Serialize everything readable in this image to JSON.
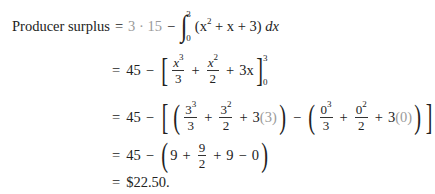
{
  "document": {
    "label": "Producer surplus",
    "lines": [
      {
        "id": "line1",
        "text": "Producer surplus = 3 · 15 − ∫_0^3 (x^2 + x + 3) dx",
        "parts": {
          "eq": "=",
          "product": "3 · 15",
          "minus": "−",
          "lower": "0",
          "upper": "3",
          "integrand": "(x",
          "exp2": "2",
          "rest": "+ x + 3)",
          "dx": "dx"
        }
      },
      {
        "id": "line2",
        "text": "= 45 − [x^3/3 + x^2/2 + 3x]_0^3",
        "parts": {
          "eq": "=",
          "const": "45",
          "minus": "−",
          "t1num": "x",
          "t1exp": "3",
          "t1den": "3",
          "plus1": "+",
          "t2num": "x",
          "t2exp": "2",
          "t2den": "2",
          "plus2": "+",
          "t3": "3x",
          "upper": "3",
          "lower": "0"
        }
      },
      {
        "id": "line3",
        "text": "= 45 − [(3^3/3 + 3^2/2 + 3(3)) − (0^3/3 + 0^2/2 + 3(0))]",
        "parts": {
          "eq": "=",
          "const": "45",
          "minus": "−",
          "a1num": "3",
          "a1exp": "3",
          "a1den": "3",
          "a2num": "3",
          "a2exp": "2",
          "a2den": "2",
          "a3": "3",
          "a3arg": "(3)",
          "minus2": "−",
          "b1num": "0",
          "b1exp": "3",
          "b1den": "3",
          "b2num": "0",
          "b2exp": "2",
          "b2den": "2",
          "b3": "3",
          "b3arg": "(0)",
          "plus": "+"
        }
      },
      {
        "id": "line4",
        "text": "= 45 − (9 + 9/2 + 9 − 0)",
        "parts": {
          "eq": "=",
          "const": "45",
          "minus": "−",
          "v1": "9",
          "plus1": "+",
          "fnum": "9",
          "fden": "2",
          "plus2": "+",
          "v3": "9",
          "minus2": "−",
          "v4": "0"
        }
      },
      {
        "id": "line5",
        "text": "= $22.50.",
        "parts": {
          "eq": "=",
          "result": "$22.50."
        }
      }
    ]
  },
  "colors": {
    "text": "#222222",
    "highlight_gray": "#9a9a9a",
    "background": "#ffffff"
  }
}
